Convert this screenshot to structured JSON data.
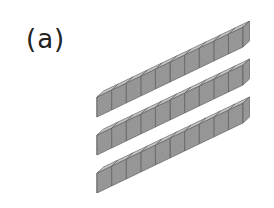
{
  "figure": {
    "label": "(a)",
    "rods": [
      {
        "cubes": 10
      },
      {
        "cubes": 10
      },
      {
        "cubes": 10
      }
    ],
    "colors": {
      "top_face": "#c8c8c8",
      "front_face": "#6e6e6e",
      "side_face": "#9a9a9a",
      "edge": "#555555"
    }
  }
}
